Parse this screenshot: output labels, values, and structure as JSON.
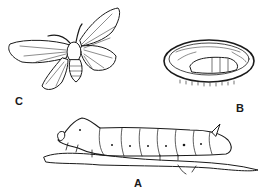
{
  "figure": {
    "type": "line-drawing",
    "ink_color": "#1a1a1a",
    "background": "#ffffff"
  },
  "labels": {
    "moth": "C",
    "cocoon": "B",
    "caterpillar": "A"
  }
}
